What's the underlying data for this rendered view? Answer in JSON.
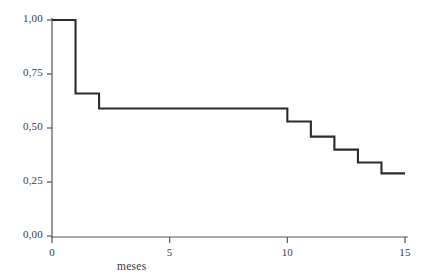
{
  "chart_data": {
    "type": "line",
    "subtype": "step-post",
    "title": "",
    "xlabel": "meses",
    "ylabel": "",
    "xlim": [
      0,
      15
    ],
    "ylim": [
      0,
      1
    ],
    "grid": false,
    "legend": false,
    "legend_position": "none",
    "line_color": "#2b2b2b",
    "axis_color": "#555555",
    "background_color": "#ffffff",
    "x_ticks": [
      0,
      5,
      10,
      15
    ],
    "x_tick_labels": [
      "0",
      "5",
      "10",
      "15"
    ],
    "y_ticks": [
      0.0,
      0.25,
      0.5,
      0.75,
      1.0
    ],
    "y_tick_labels": [
      "0,00",
      "0,25",
      "0,50",
      "0,75",
      "1,00"
    ],
    "series": [
      {
        "name": "supervivencia",
        "x": [
          0,
          1,
          1,
          2,
          2,
          10,
          10,
          11,
          11,
          12,
          12,
          13,
          13,
          14,
          14,
          15
        ],
        "y": [
          1.0,
          1.0,
          0.66,
          0.66,
          0.59,
          0.59,
          0.53,
          0.53,
          0.46,
          0.46,
          0.4,
          0.4,
          0.34,
          0.34,
          0.29,
          0.29
        ]
      }
    ],
    "steps": [
      {
        "month": 0,
        "survival": 1.0
      },
      {
        "month": 1,
        "survival": 0.66
      },
      {
        "month": 2,
        "survival": 0.59
      },
      {
        "month": 10,
        "survival": 0.53
      },
      {
        "month": 11,
        "survival": 0.46
      },
      {
        "month": 12,
        "survival": 0.4
      },
      {
        "month": 13,
        "survival": 0.34
      },
      {
        "month": 14,
        "survival": 0.29
      },
      {
        "month": 15,
        "survival": 0.29
      }
    ]
  }
}
